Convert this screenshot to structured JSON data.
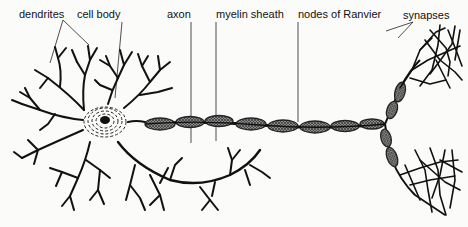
{
  "diagram": {
    "labels": [
      {
        "id": "dendrites",
        "text": "dendrites"
      },
      {
        "id": "cell_body",
        "text": "cell body"
      },
      {
        "id": "axon",
        "text": "axon"
      },
      {
        "id": "myelin_sheath",
        "text": "myelin sheath"
      },
      {
        "id": "nodes_of_ranvier",
        "text": "nodes of Ranvier"
      },
      {
        "id": "synapses",
        "text": "synapses"
      }
    ],
    "colors": {
      "ink": "#111111",
      "background": "#fbfbfa",
      "myelin_fill": "#6e6e6e"
    }
  }
}
